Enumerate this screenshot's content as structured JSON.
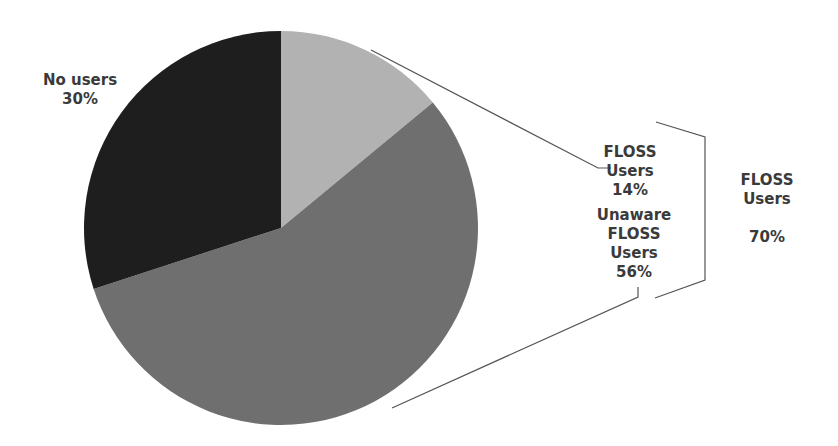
{
  "chart_data": {
    "type": "pie",
    "title": "",
    "slices": [
      {
        "label": "FLOSS Users",
        "value": 14,
        "display": "14%",
        "color": "#b2b2b2"
      },
      {
        "label": "Unaware FLOSS Users",
        "value": 56,
        "display": "56%",
        "color": "#6f6f6f"
      },
      {
        "label": "No users",
        "value": 30,
        "display": "30%",
        "color": "#1e1e1e"
      }
    ],
    "group_annotation": {
      "label": "FLOSS Users",
      "value": 70,
      "display": "70%",
      "members": [
        "FLOSS Users",
        "Unaware FLOSS Users"
      ]
    },
    "start_angle_deg": 0,
    "direction": "clockwise",
    "legend": "none (data labels)"
  },
  "labels": {
    "no_users": {
      "line1": "No users",
      "line2": "30%"
    },
    "floss_users": {
      "line1": "FLOSS",
      "line2": "Users",
      "line3": "14%"
    },
    "unaware": {
      "line1": "Unaware",
      "line2": "FLOSS",
      "line3": "Users",
      "line4": "56%"
    },
    "group": {
      "line1": "FLOSS",
      "line2": "Users",
      "line3": "70%"
    }
  },
  "colors": {
    "leader_line": "#555555",
    "text": "#3a3a3a"
  }
}
